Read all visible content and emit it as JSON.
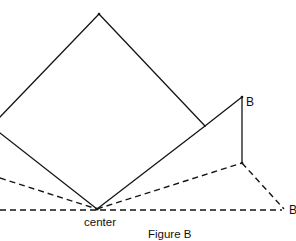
{
  "figure": {
    "caption": "Figure B",
    "labels": {
      "center": "center",
      "point_b": "B",
      "point_b_prime": "B"
    },
    "colors": {
      "line": "#151515",
      "background": "#ffffff"
    },
    "points": {
      "square_top": [
        99,
        14
      ],
      "square_left_upper_cut": [
        0,
        117
      ],
      "square_left_lower_cut": [
        0,
        133
      ],
      "center": [
        97,
        209
      ],
      "square_right": [
        205,
        126
      ],
      "B": [
        242,
        97
      ],
      "below_B": [
        242,
        163
      ],
      "B_prime": [
        284,
        209
      ],
      "dashed_left_end": [
        0,
        178
      ],
      "baseline_left_end": [
        0,
        210
      ]
    },
    "solid_segments": [
      [
        "square_left_upper_cut",
        "square_top"
      ],
      [
        "square_top",
        "square_right"
      ],
      [
        "square_left_lower_cut",
        "center"
      ],
      [
        "center",
        "square_right"
      ],
      [
        "square_right",
        "B"
      ],
      [
        "B",
        "below_B"
      ]
    ],
    "dashed_segments": [
      [
        "baseline_left_end",
        "B_prime"
      ],
      [
        "dashed_left_end",
        "center"
      ],
      [
        "center",
        "below_B"
      ],
      [
        "below_B",
        "B_prime"
      ]
    ]
  }
}
